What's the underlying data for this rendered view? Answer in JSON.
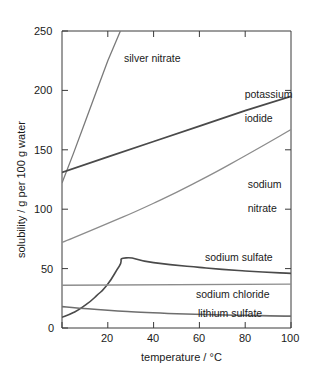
{
  "chart_data": {
    "type": "line",
    "title": "",
    "xlabel": "temperature / °C",
    "ylabel": "solubility / g per 100 g water",
    "xlim": [
      0,
      100
    ],
    "ylim": [
      0,
      250
    ],
    "xticks": [
      "0",
      "20",
      "40",
      "60",
      "80",
      "100"
    ],
    "yticks": [
      "0",
      "50",
      "100",
      "150",
      "200",
      "250"
    ],
    "grid": false,
    "legend_position": "inline-annotations",
    "series": [
      {
        "name": "silver nitrate",
        "label": "silver nitrate",
        "color": "#7a7a7a",
        "x": [
          0,
          5,
          10,
          15,
          20,
          25.5
        ],
        "values": [
          122,
          147,
          173,
          199,
          225,
          250
        ]
      },
      {
        "name": "potassium iodide",
        "label": "potassium iodide",
        "color": "#4a4a4a",
        "x": [
          0,
          20,
          40,
          60,
          80,
          100
        ],
        "values": [
          131,
          144,
          157,
          170,
          183,
          195
        ]
      },
      {
        "name": "sodium nitrate",
        "label": "sodium nitrate",
        "color": "#8c8c8c",
        "x": [
          0,
          20,
          40,
          60,
          80,
          100
        ],
        "values": [
          72,
          88,
          105,
          124,
          145,
          167
        ]
      },
      {
        "name": "sodium sulfate",
        "label": "sodium sulfate",
        "color": "#4a4a4a",
        "x": [
          0,
          5,
          10,
          15,
          20,
          25,
          28,
          40,
          60,
          80,
          100
        ],
        "values": [
          9,
          13,
          19,
          27,
          37,
          52,
          59,
          55,
          51,
          48,
          46
        ]
      },
      {
        "name": "sodium chloride",
        "label": "sodium chloride",
        "color": "#8c8c8c",
        "x": [
          0,
          100
        ],
        "values": [
          36,
          37
        ]
      },
      {
        "name": "lithium sulfate",
        "label": "lithium sulfate",
        "color": "#6e6e6e",
        "x": [
          0,
          20,
          50,
          100
        ],
        "values": [
          18,
          15,
          12,
          10
        ]
      }
    ]
  },
  "axes": {
    "x_title": "temperature / °C",
    "y_title": "solubility / g per 100 g water",
    "x_tick_labels": [
      "0",
      "20",
      "40",
      "60",
      "80",
      "100"
    ],
    "y_tick_labels": [
      "0",
      "50",
      "100",
      "150",
      "200",
      "250"
    ]
  },
  "annotations": {
    "silver_nitrate": "silver nitrate",
    "potassium_iodide_line1": "potassium",
    "potassium_iodide_line2": "iodide",
    "sodium_nitrate_line1": "sodium",
    "sodium_nitrate_line2": "nitrate",
    "sodium_sulfate": "sodium sulfate",
    "sodium_chloride": "sodium chloride",
    "lithium_sulfate": "lithium sulfate"
  },
  "colors": {
    "background": "#ffffff",
    "axis": "#3a3a3a",
    "text": "#1a1a1a"
  }
}
